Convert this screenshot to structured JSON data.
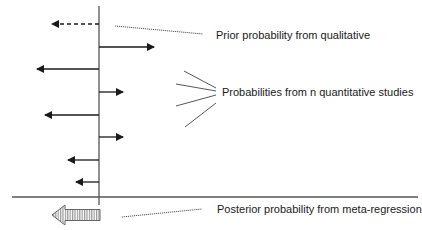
{
  "diagram": {
    "title": "",
    "colors": {
      "axis": "#555555",
      "arrow": "#1a1a1a",
      "callout": "#444444",
      "posterior_stroke": "#666666",
      "posterior_stripe": "#999999",
      "text": "#1a1a1a"
    },
    "axes": {
      "vertical": {
        "x": 99,
        "y1": 6,
        "y2": 205
      },
      "horizontal": {
        "y": 197,
        "x1": 12,
        "x2": 418
      }
    },
    "prior": {
      "label": "Prior probability from qualitative",
      "arrow": {
        "y": 24,
        "from_x": 99,
        "to_x": 52,
        "style": "dashed",
        "direction": "left"
      },
      "callout": {
        "x1": 115,
        "y1": 26,
        "x2": 203,
        "y2": 34
      },
      "label_pos": {
        "x": 216,
        "y": 29
      }
    },
    "studies": {
      "label": "Probabilities from n quantitative studies",
      "arrows": [
        {
          "y": 47,
          "from_x": 99,
          "to_x": 154,
          "direction": "right"
        },
        {
          "y": 69,
          "from_x": 99,
          "to_x": 37,
          "direction": "left"
        },
        {
          "y": 92,
          "from_x": 99,
          "to_x": 123,
          "direction": "right"
        },
        {
          "y": 115,
          "from_x": 99,
          "to_x": 45,
          "direction": "left"
        },
        {
          "y": 137,
          "from_x": 99,
          "to_x": 123,
          "direction": "right"
        },
        {
          "y": 160,
          "from_x": 99,
          "to_x": 68,
          "direction": "left"
        },
        {
          "y": 182,
          "from_x": 99,
          "to_x": 76,
          "direction": "left"
        }
      ],
      "callouts": [
        {
          "x1": 184,
          "y1": 71,
          "x2": 216,
          "y2": 88
        },
        {
          "x1": 176,
          "y1": 84,
          "x2": 216,
          "y2": 91
        },
        {
          "x1": 176,
          "y1": 106,
          "x2": 216,
          "y2": 95
        },
        {
          "x1": 185,
          "y1": 127,
          "x2": 216,
          "y2": 103
        }
      ],
      "label_pos": {
        "x": 222,
        "y": 86
      }
    },
    "posterior": {
      "label": "Posterior probability from meta-regression",
      "arrow": {
        "tip_x": 52,
        "head_base_x": 65,
        "tail_x": 100,
        "center_y": 215,
        "shaft_half": 5.5,
        "head_half": 10,
        "style": "striped",
        "direction": "left"
      },
      "callout": {
        "x1": 122,
        "y1": 217,
        "x2": 202,
        "y2": 209
      },
      "label_pos": {
        "x": 217,
        "y": 203
      }
    }
  }
}
